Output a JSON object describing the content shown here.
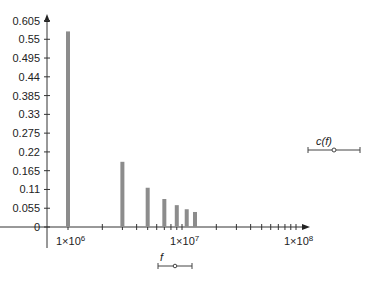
{
  "chart_data": {
    "type": "bar",
    "title": "",
    "xlabel": "f",
    "ylabel": "c(f)",
    "x_scale": "log",
    "x": [
      1000000,
      3000000,
      5000000,
      7000000,
      9000000,
      11000000,
      13000000
    ],
    "values": [
      0.573,
      0.191,
      0.115,
      0.082,
      0.064,
      0.052,
      0.044
    ],
    "y_ticks": [
      "0",
      "0.055",
      "0.11",
      "0.165",
      "0.22",
      "0.275",
      "0.33",
      "0.385",
      "0.44",
      "0.495",
      "0.55",
      "0.605"
    ],
    "x_tick_labels": [
      "1×10",
      "1×10",
      "1×10"
    ],
    "x_tick_exponents": [
      "6",
      "7",
      "8"
    ],
    "ylim": [
      0,
      0.605
    ],
    "xlim": [
      1000000,
      100000000
    ],
    "grid": false,
    "legend": "none",
    "bar_color": "#8c8c8c"
  },
  "axis_labels": {
    "y_label": "c(f)",
    "x_label": "f"
  }
}
